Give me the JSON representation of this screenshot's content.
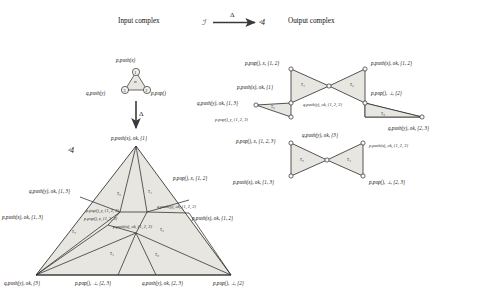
{
  "figure": {
    "headers": {
      "input_complex": "Input complex",
      "output_complex": "Output complex",
      "input_symbol": "ℐ",
      "output_symbol": "ᵈ4",
      "map_symbol": "Δ",
      "vertical_map_symbol": "Δ",
      "output_symbol_left": "ᵈ4"
    },
    "input_complex": {
      "vertices": [
        {
          "id": "1",
          "label": "1",
          "process_label": "p.push(x)"
        },
        {
          "id": "2",
          "label": "2",
          "process_label": "p.pop()"
        },
        {
          "id": "3",
          "label": "3",
          "process_label": "q.push(y)"
        }
      ],
      "face_label": "σ"
    },
    "big_output_complex": {
      "apex_label": "p.push(x), ok, {1}",
      "triangles": [
        "τ₁",
        "τ₂",
        "τ₃",
        "τ₄",
        "τ₅",
        "τ₆"
      ],
      "labels": {
        "left_upper": "q.push(y), ok, {1, 3}",
        "left_mid": "p.push(x), ok, {1, 3}",
        "right_upper": "p.pop(), x, {1, 2}",
        "right_mid_inner": "q.push(y), ok, {1, 2, 3}",
        "right_mid": "p.push(x), ok, {1, 2}",
        "center_upper": "p.pop(), y, {1, 2, 3}",
        "center_mid": "p.pop(), x, {1, 2, 3}",
        "center_lower": "p.push(x), ok, {1, 2, 3}",
        "bottom_left": "q.push(y), ok, {3}",
        "bottom_mid_left": "p.pop(), ⊥, {2, 3}",
        "bottom_mid_right": "q.push(y), ok, {2, 3}",
        "bottom_right": "p.pop(), ⊥, {2}"
      }
    },
    "right_output_complex": {
      "triangles": [
        "τ₁",
        "τ₂",
        "τ₃",
        "τ₄",
        "τ₅",
        "τ₆"
      ],
      "labels": {
        "top_left": "p.pop(), x, {1, 2}",
        "top_right": "p.push(x), ok, {1, 2}",
        "upper_left_inner": "p.push(x), ok, {1}",
        "right_upper": "p.pop(), ⊥, {2}",
        "far_left": "q.push(y), ok, {1, 3}",
        "center_top": "q.push(y), ok, {1, 2, 3}",
        "left_lower_small": "p.pop(), y, {1, 2, 3}",
        "far_right": "q.push(y), ok, {2, 3}",
        "mid_left_lower": "p.pop(), x, {1, 2, 3}",
        "center_lower": "q.push(y), ok, {3}",
        "right_lower_inner": "p.push(x), ok, {1, 2, 3}",
        "bottom_left": "p.push(x), ok, {1, 3}",
        "bottom_right": "p.pop(), ⊥, {2, 3}"
      }
    },
    "colors": {
      "fill": "#e8e6e1",
      "stroke": "#2b2b2b",
      "text": "#15130f",
      "background": "#ffffff"
    }
  }
}
